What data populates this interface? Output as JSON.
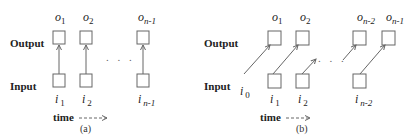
{
  "labels": {
    "output": "Output",
    "input": "Input",
    "time": "time"
  },
  "panel_a": {
    "caption": "(a)",
    "outputs": [
      {
        "base": "o",
        "sub": "1"
      },
      {
        "base": "o",
        "sub": "2"
      },
      {
        "base": "o",
        "sub": "n-1"
      }
    ],
    "inputs": [
      {
        "base": "i",
        "sub": "1"
      },
      {
        "base": "i",
        "sub": "2"
      },
      {
        "base": "i",
        "sub": "n-1"
      }
    ],
    "ellipsis": ". . ."
  },
  "panel_b": {
    "caption": "(b)",
    "outputs": [
      {
        "base": "o",
        "sub": "1"
      },
      {
        "base": "o",
        "sub": "2"
      },
      {
        "base": "o",
        "sub": "n-2"
      },
      {
        "base": "o",
        "sub": "n-1"
      }
    ],
    "inputs": [
      {
        "base": "i",
        "sub": "0"
      },
      {
        "base": "i",
        "sub": "1"
      },
      {
        "base": "i",
        "sub": "2"
      },
      {
        "base": "i",
        "sub": "n-2"
      }
    ],
    "ellipsis": ". . ."
  }
}
